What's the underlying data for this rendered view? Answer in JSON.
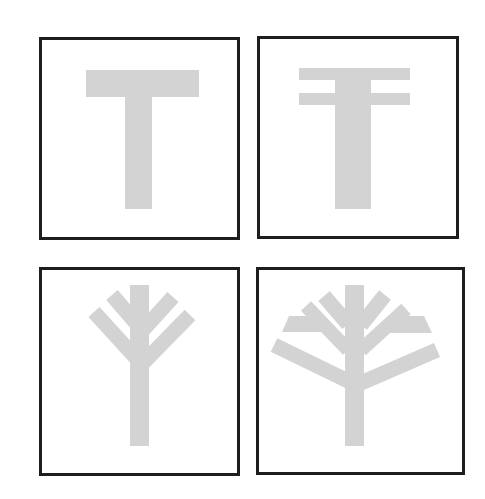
{
  "figure": {
    "shape_color": "#d3d3d3",
    "frame_color": "#1e1e1e",
    "panels": [
      {
        "id": "panel-1",
        "label": "T shape"
      },
      {
        "id": "panel-2",
        "label": "double-bar T shape"
      },
      {
        "id": "panel-3",
        "label": "simple tree with four branches"
      },
      {
        "id": "panel-4",
        "label": "full tree with eight branches"
      }
    ]
  }
}
